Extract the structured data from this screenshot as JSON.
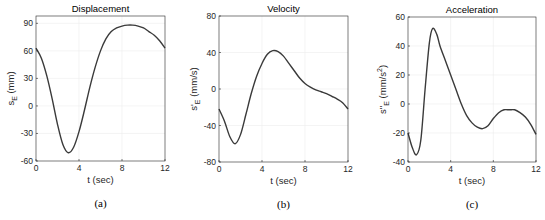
{
  "chart_data": [
    {
      "type": "line",
      "panel_caption": "(a)",
      "title": "Displacement",
      "xlabel": "t (sec)",
      "ylabel": "s_E (mm)",
      "ylabel_main": "s",
      "ylabel_sub": "E",
      "ylabel_unit": " (mm)",
      "xlim": [
        0,
        12
      ],
      "ylim": [
        -60,
        98
      ],
      "xticks": [
        0,
        4,
        8,
        12
      ],
      "yticks": [
        -60,
        -30,
        0,
        30,
        60,
        90
      ],
      "grid": true,
      "x": [
        0,
        0.5,
        1,
        1.5,
        2,
        2.5,
        3,
        3.5,
        4,
        4.5,
        5,
        5.5,
        6,
        6.5,
        7,
        7.5,
        8,
        8.5,
        9,
        9.5,
        10,
        10.5,
        11,
        11.5,
        12
      ],
      "values": [
        63,
        52,
        33,
        8,
        -20,
        -42,
        -51,
        -45,
        -28,
        -5,
        20,
        42,
        60,
        73,
        81,
        85,
        87,
        88,
        88,
        87,
        85,
        81,
        77,
        71,
        63
      ]
    },
    {
      "type": "line",
      "panel_caption": "(b)",
      "title": "Velocity",
      "xlabel": "t (sec)",
      "ylabel": "s'_E (mm/s)",
      "ylabel_main": "s'",
      "ylabel_sub": "E",
      "ylabel_unit": " (mm/s)",
      "xlim": [
        0,
        12
      ],
      "ylim": [
        -80,
        80
      ],
      "xticks": [
        0,
        4,
        8,
        12
      ],
      "yticks": [
        -80,
        -40,
        0,
        40,
        80
      ],
      "grid": true,
      "x": [
        0,
        0.5,
        1,
        1.5,
        2,
        2.5,
        3,
        3.5,
        4,
        4.5,
        5,
        5.5,
        6,
        6.5,
        7,
        7.5,
        8,
        8.5,
        9,
        9.5,
        10,
        10.5,
        11,
        11.5,
        12
      ],
      "values": [
        -22,
        -35,
        -52,
        -60,
        -50,
        -28,
        -5,
        14,
        28,
        38,
        42,
        41,
        36,
        28,
        20,
        12,
        6,
        2,
        -1,
        -3,
        -5,
        -8,
        -11,
        -15,
        -22
      ]
    },
    {
      "type": "line",
      "panel_caption": "(c)",
      "title": "Acceleration",
      "xlabel": "t (sec)",
      "ylabel": "s''_E (mm/s^2)",
      "ylabel_main": "s''",
      "ylabel_sub": "E",
      "ylabel_unit": " (mm/s",
      "ylabel_sup": "2",
      "ylabel_close": ")",
      "xlim": [
        0,
        12
      ],
      "ylim": [
        -40,
        60
      ],
      "xticks": [
        0,
        4,
        8,
        12
      ],
      "yticks": [
        -40,
        -20,
        0,
        20,
        40,
        60
      ],
      "grid": true,
      "x": [
        0,
        0.4,
        0.8,
        1.2,
        1.6,
        2.0,
        2.3,
        2.7,
        3.0,
        3.5,
        4,
        4.5,
        5,
        5.5,
        6,
        6.5,
        7,
        7.5,
        8,
        8.5,
        9,
        9.5,
        10,
        10.5,
        11,
        11.5,
        12
      ],
      "values": [
        -20,
        -30,
        -35,
        -25,
        10,
        42,
        52,
        48,
        40,
        30,
        20,
        10,
        0,
        -8,
        -13,
        -16,
        -17,
        -15,
        -10,
        -6,
        -4,
        -4,
        -4,
        -6,
        -9,
        -14,
        -21
      ]
    }
  ]
}
